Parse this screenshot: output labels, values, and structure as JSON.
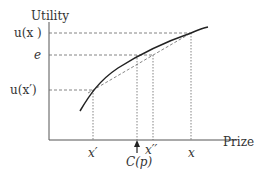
{
  "figure": {
    "y_axis_label": "Utility",
    "x_axis_label": "Prize",
    "y_ticks": {
      "u_x": "u(x )",
      "e": "e",
      "u_xp": "u(x′)"
    },
    "x_ticks": {
      "xp": "x′",
      "xpp": "x′′",
      "x": "x",
      "cp": "C(p)"
    },
    "colors": {
      "curve": "#222222",
      "axis": "#555555",
      "dashed": "#666666"
    }
  }
}
